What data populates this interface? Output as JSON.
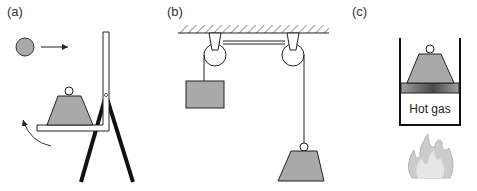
{
  "panels": [
    {
      "id": "a",
      "label": "(a)",
      "description": "Ball moving toward a lever with a weight on a shelf supported by a tripod"
    },
    {
      "id": "b",
      "label": "(b)",
      "description": "Two pulleys hung from a ceiling lifting a block and a trapezoidal weight"
    },
    {
      "id": "c",
      "label": "(c)",
      "description": "Weight on a piston pushed up by hot gas heated by a flame"
    }
  ],
  "text": {
    "hot_gas": "Hot gas"
  },
  "colors": {
    "fill_gray": "#a9a9a9",
    "stroke": "#1a1a1a",
    "flame": "#b0b0b0",
    "piston_dark": "#555555"
  }
}
